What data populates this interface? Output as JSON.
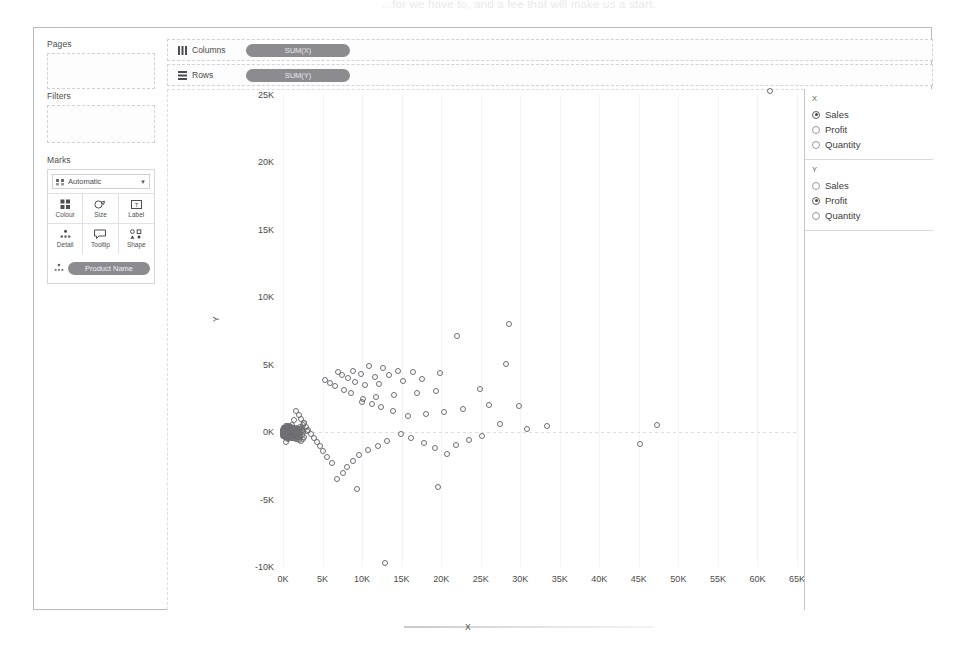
{
  "page": {
    "ghost_text_top": "...for we have to, and a fee that will make us a start.",
    "background": "#ffffff"
  },
  "left_rail": {
    "pages": {
      "title": "Pages"
    },
    "filters": {
      "title": "Filters"
    },
    "marks": {
      "title": "Marks",
      "mark_type": "Automatic",
      "mark_type_icon": "marks-type-icon",
      "caret_icon": "chevron-down-icon",
      "buttons": [
        {
          "label": "Colour",
          "icon": "colour-icon"
        },
        {
          "label": "Size",
          "icon": "size-icon"
        },
        {
          "label": "Label",
          "icon": "label-icon"
        },
        {
          "label": "Detail",
          "icon": "detail-icon"
        },
        {
          "label": "Tooltip",
          "icon": "tooltip-icon"
        },
        {
          "label": "Shape",
          "icon": "shape-icon"
        }
      ],
      "detail_pill": {
        "label": "Product Name",
        "icon": "detail-icon"
      }
    }
  },
  "shelves": [
    {
      "name": "Columns",
      "icon": "columns-icon",
      "pill": "SUM(X)"
    },
    {
      "name": "Rows",
      "icon": "rows-icon",
      "pill": "SUM(Y)"
    }
  ],
  "legend_panel": {
    "parameters": [
      {
        "title": "X",
        "options": [
          "Sales",
          "Profit",
          "Quantity"
        ],
        "selected": "Sales"
      },
      {
        "title": "Y",
        "options": [
          "Sales",
          "Profit",
          "Quantity"
        ],
        "selected": "Profit"
      }
    ]
  },
  "chart_data": {
    "type": "scatter",
    "title": "",
    "xlabel": "X",
    "ylabel": "Y",
    "xlim": [
      0,
      65000
    ],
    "ylim": [
      -10000,
      25000
    ],
    "xticks": [
      "0K",
      "5K",
      "10K",
      "15K",
      "20K",
      "25K",
      "30K",
      "35K",
      "40K",
      "45K",
      "50K",
      "55K",
      "60K",
      "65K"
    ],
    "xtick_values": [
      0,
      5000,
      10000,
      15000,
      20000,
      25000,
      30000,
      35000,
      40000,
      45000,
      50000,
      55000,
      60000,
      65000
    ],
    "yticks": [
      "25K",
      "20K",
      "15K",
      "10K",
      "5K",
      "0K",
      "-5K",
      "-10K"
    ],
    "ytick_values": [
      25000,
      20000,
      15000,
      10000,
      5000,
      0,
      -5000,
      -10000
    ],
    "grid": "faint-vertical-plus-zero-reference-line",
    "legend": "none",
    "marker": "open-circle",
    "marker_color": "#6e6e73",
    "series_name": "Product Name",
    "encoding": {
      "x": "SUM(Sales)",
      "y": "SUM(Profit)",
      "detail": "Product Name"
    },
    "point_count_approx": 1860,
    "points": [
      [
        61600,
        25300
      ],
      [
        28600,
        8000
      ],
      [
        22000,
        7100
      ],
      [
        28200,
        5050
      ],
      [
        19900,
        4350
      ],
      [
        16400,
        4450
      ],
      [
        14600,
        4550
      ],
      [
        12700,
        4750
      ],
      [
        10900,
        4900
      ],
      [
        13400,
        4250
      ],
      [
        11600,
        4100
      ],
      [
        9900,
        4300
      ],
      [
        8800,
        4550
      ],
      [
        17600,
        3950
      ],
      [
        15200,
        3800
      ],
      [
        12100,
        3600
      ],
      [
        10400,
        3500
      ],
      [
        9100,
        3750
      ],
      [
        8200,
        4000
      ],
      [
        7400,
        4250
      ],
      [
        6900,
        4450
      ],
      [
        24900,
        3200
      ],
      [
        19400,
        3050
      ],
      [
        16900,
        2900
      ],
      [
        14100,
        2750
      ],
      [
        11800,
        2600
      ],
      [
        10100,
        2450
      ],
      [
        8600,
        2900
      ],
      [
        7700,
        3100
      ],
      [
        6600,
        3400
      ],
      [
        5900,
        3650
      ],
      [
        5300,
        3900
      ],
      [
        29800,
        1950
      ],
      [
        26100,
        2000
      ],
      [
        22700,
        1750
      ],
      [
        20300,
        1500
      ],
      [
        18100,
        1350
      ],
      [
        15800,
        1200
      ],
      [
        13900,
        1600
      ],
      [
        12400,
        1850
      ],
      [
        11200,
        2100
      ],
      [
        10000,
        2250
      ],
      [
        47300,
        500
      ],
      [
        45100,
        -850
      ],
      [
        33400,
        450
      ],
      [
        30900,
        250
      ],
      [
        27400,
        600
      ],
      [
        25200,
        -300
      ],
      [
        23500,
        -550
      ],
      [
        21900,
        -950
      ],
      [
        20800,
        -1600
      ],
      [
        19200,
        -1200
      ],
      [
        17800,
        -800
      ],
      [
        16200,
        -400
      ],
      [
        14900,
        -150
      ],
      [
        13100,
        -650
      ],
      [
        12000,
        -1000
      ],
      [
        10800,
        -1350
      ],
      [
        9600,
        -1700
      ],
      [
        8900,
        -2150
      ],
      [
        8100,
        -2600
      ],
      [
        7600,
        -3050
      ],
      [
        6800,
        -3500
      ],
      [
        9400,
        -4200
      ],
      [
        19600,
        -4100
      ],
      [
        12900,
        -9700
      ],
      [
        6200,
        -2300
      ],
      [
        5600,
        -1850
      ],
      [
        5100,
        -1400
      ],
      [
        4700,
        -1000
      ],
      [
        4300,
        -700
      ],
      [
        3900,
        -400
      ],
      [
        3500,
        -150
      ],
      [
        3200,
        150
      ],
      [
        2900,
        400
      ],
      [
        2600,
        700
      ],
      [
        2300,
        1000
      ],
      [
        2000,
        1300
      ],
      [
        1700,
        1600
      ],
      [
        1400,
        900
      ],
      [
        1100,
        500
      ],
      [
        900,
        200
      ],
      [
        700,
        -100
      ],
      [
        500,
        -400
      ],
      [
        350,
        -700
      ],
      [
        250,
        -250
      ],
      [
        150,
        100
      ],
      [
        80,
        -50
      ]
    ]
  }
}
